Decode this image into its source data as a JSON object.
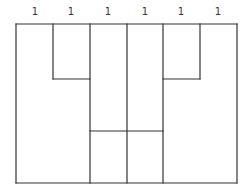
{
  "diagram": {
    "column_labels": [
      "1",
      "1",
      "1",
      "1",
      "1",
      "1"
    ],
    "label_x": [
      35,
      71,
      108,
      145,
      181,
      218
    ],
    "line_color": "#333333",
    "lines": [
      {
        "x1": 16,
        "y1": 24,
        "x2": 237,
        "y2": 24
      },
      {
        "x1": 16,
        "y1": 24,
        "x2": 16,
        "y2": 183
      },
      {
        "x1": 237,
        "y1": 24,
        "x2": 237,
        "y2": 183
      },
      {
        "x1": 16,
        "y1": 183,
        "x2": 237,
        "y2": 183
      },
      {
        "x1": 53,
        "y1": 24,
        "x2": 53,
        "y2": 79
      },
      {
        "x1": 53,
        "y1": 79,
        "x2": 90,
        "y2": 79
      },
      {
        "x1": 90,
        "y1": 24,
        "x2": 90,
        "y2": 183
      },
      {
        "x1": 127,
        "y1": 24,
        "x2": 127,
        "y2": 183
      },
      {
        "x1": 163,
        "y1": 24,
        "x2": 163,
        "y2": 183
      },
      {
        "x1": 163,
        "y1": 79,
        "x2": 200,
        "y2": 79
      },
      {
        "x1": 200,
        "y1": 24,
        "x2": 200,
        "y2": 79
      },
      {
        "x1": 90,
        "y1": 131,
        "x2": 163,
        "y2": 131
      }
    ]
  }
}
